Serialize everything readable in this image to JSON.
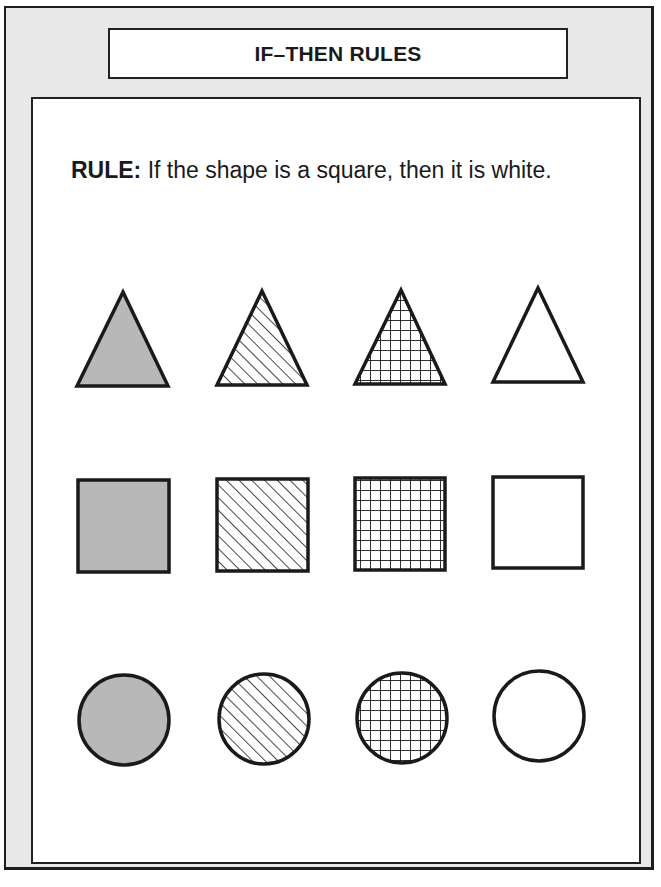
{
  "title": "IF–THEN RULES",
  "rule": {
    "label": "RULE:",
    "text": " If the shape is a square, then it is white."
  },
  "colors": {
    "frame_gray": "#e8e8e8",
    "shape_gray": "#b8b8b8",
    "stroke": "#1a1a1a",
    "white": "#ffffff"
  },
  "grid": {
    "rows": [
      {
        "shape": "triangle",
        "fills": [
          "gray",
          "diagonal-hatch",
          "crosshatch",
          "white"
        ]
      },
      {
        "shape": "square",
        "fills": [
          "gray",
          "diagonal-hatch",
          "crosshatch",
          "white"
        ]
      },
      {
        "shape": "circle",
        "fills": [
          "gray",
          "diagonal-hatch",
          "crosshatch",
          "white"
        ]
      }
    ]
  }
}
